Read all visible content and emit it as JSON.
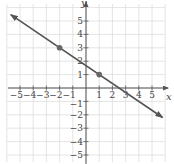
{
  "chart_data": {
    "type": "line",
    "title": "",
    "xlabel": "x",
    "ylabel": "y",
    "xlim": [
      -6,
      6
    ],
    "ylim": [
      -6,
      6
    ],
    "grid": true,
    "x_ticks": [
      -5,
      -4,
      -3,
      -2,
      -1,
      1,
      2,
      3,
      4,
      5
    ],
    "y_ticks": [
      -5,
      -4,
      -3,
      -2,
      -1,
      1,
      2,
      3,
      4,
      5
    ],
    "x_tick_labels": [
      "−5",
      "−4",
      "−3",
      "−2",
      "−1",
      "1",
      "2",
      "3",
      "4",
      "5"
    ],
    "y_tick_labels": [
      "−5",
      "−4",
      "−3",
      "−2",
      "−1",
      "1",
      "2",
      "3",
      "4",
      "5"
    ],
    "series": [
      {
        "name": "line",
        "equation": "y = -2/3 x + 5/3",
        "slope": -0.6667,
        "intercept": 1.6667,
        "x": [
          -5.7,
          5.8
        ],
        "y": [
          5.47,
          -2.2
        ],
        "arrows": "both"
      }
    ],
    "points": [
      {
        "x": -2,
        "y": 3
      },
      {
        "x": 1,
        "y": 1
      }
    ]
  },
  "colors": {
    "line": "#555555",
    "point": "#666666",
    "grid": "#dddddd",
    "axis": "#555555",
    "text": "#444444"
  },
  "labels": {
    "x_axis": "x",
    "y_axis": "y"
  }
}
